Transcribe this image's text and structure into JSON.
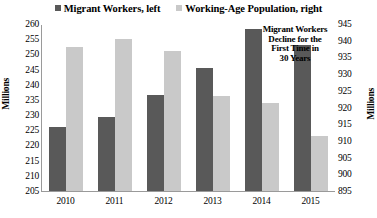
{
  "chart_data": {
    "type": "bar",
    "title": "",
    "xlabel": "",
    "categories": [
      "2010",
      "2011",
      "2012",
      "2013",
      "2014",
      "2015"
    ],
    "series": [
      {
        "name": "Migrant Workers, left",
        "axis": "left",
        "color": "#595959",
        "values": [
          226,
          229.5,
          236.5,
          245.5,
          258.5,
          253
        ]
      },
      {
        "name": "Working-Age Population, right",
        "axis": "right",
        "color": "#c9c9c9",
        "values": [
          938,
          940.5,
          937,
          923.5,
          921.5,
          911.5
        ]
      }
    ],
    "axes": {
      "left": {
        "label": "Millions",
        "min": 205,
        "max": 260,
        "step": 5,
        "ticks": [
          "260",
          "255",
          "250",
          "245",
          "240",
          "235",
          "230",
          "225",
          "220",
          "215",
          "210",
          "205"
        ]
      },
      "right": {
        "label": "Millions",
        "min": 895,
        "max": 945,
        "step": 5,
        "ticks": [
          "945",
          "940",
          "935",
          "930",
          "925",
          "920",
          "915",
          "910",
          "905",
          "900",
          "895"
        ]
      }
    },
    "grid": false,
    "legend_position": "top",
    "annotations": [
      {
        "lines": [
          "Migrant Workers",
          "Decline for the",
          "First Time in",
          "30 Years"
        ]
      }
    ]
  }
}
